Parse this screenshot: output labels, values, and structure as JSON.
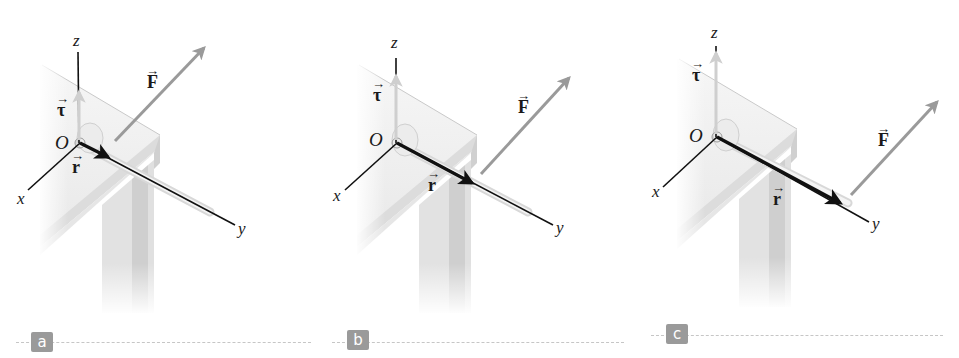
{
  "figure": {
    "colors": {
      "axis": "#111111",
      "position_vector": "#111111",
      "force_vector": "#9a9a9a",
      "torque_vector": "#cfcfcf",
      "table_top": "#efefef",
      "table_edge": "#d6d6d6",
      "badge_bg": "#9a9a9a",
      "separator": "#c6c6c6"
    },
    "panels": [
      {
        "id": "a",
        "badge": "a",
        "labels": {
          "x": "x",
          "y": "y",
          "z": "z",
          "origin": "O",
          "r": "r",
          "F": "F",
          "tau": "τ",
          "arrow": "→"
        }
      },
      {
        "id": "b",
        "badge": "b",
        "labels": {
          "x": "x",
          "y": "y",
          "z": "z",
          "origin": "O",
          "r": "r",
          "F": "F",
          "tau": "τ",
          "arrow": "→"
        }
      },
      {
        "id": "c",
        "badge": "c",
        "labels": {
          "x": "x",
          "y": "y",
          "z": "z",
          "origin": "O",
          "r": "r",
          "F": "F",
          "tau": "τ",
          "arrow": "→"
        }
      }
    ]
  }
}
